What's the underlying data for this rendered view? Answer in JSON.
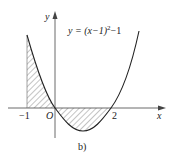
{
  "figure": {
    "equation": "y = (x−1)²−1",
    "equation_parts": {
      "lhs": "y = (x−1)",
      "sup": "2",
      "rhs": "−1"
    },
    "caption": "b)",
    "axis_labels": {
      "x": "x",
      "y": "y",
      "origin": "O"
    },
    "tick_labels": {
      "neg_one": "−1",
      "two": "2"
    },
    "colors": {
      "curve": "#222222",
      "axis": "#444444",
      "hatch": "#555555"
    },
    "shaded_regions": [
      {
        "from": -1,
        "to": 0,
        "description": "area between curve and x-axis, above axis"
      },
      {
        "from": 0,
        "to": 2,
        "description": "area between curve and x-axis, below axis"
      }
    ]
  }
}
